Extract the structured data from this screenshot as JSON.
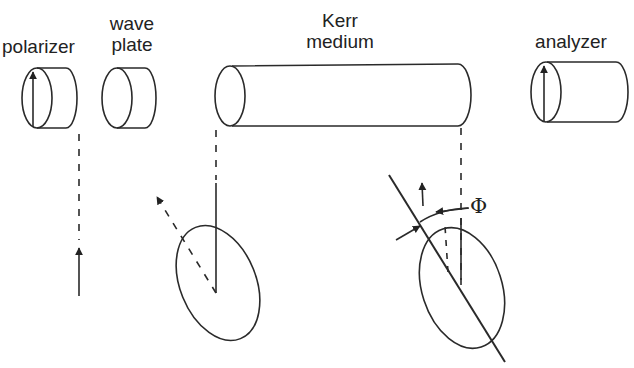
{
  "diagram": {
    "components": [
      {
        "id": "polarizer",
        "label": "polarizer"
      },
      {
        "id": "wave_plate",
        "label_line1": "wave",
        "label_line2": "plate"
      },
      {
        "id": "kerr_medium",
        "label_line1": "Kerr",
        "label_line2": "medium"
      },
      {
        "id": "analyzer",
        "label": "analyzer"
      }
    ],
    "angle_symbol": "Φ",
    "colors": {
      "stroke": "#2a2a2a",
      "background": "#ffffff"
    }
  }
}
